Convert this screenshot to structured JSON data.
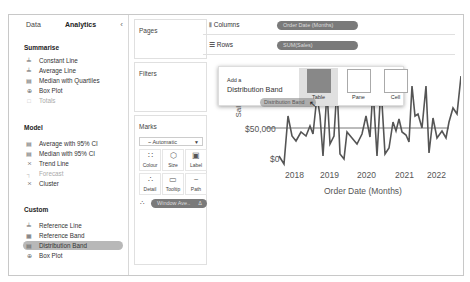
{
  "left_panel": {
    "tabs": [
      {
        "label": "Data"
      },
      {
        "label": "Analytics"
      }
    ],
    "collapse_icon": "chevron-left",
    "sections": {
      "summarise": {
        "title": "Summarise",
        "items": [
          {
            "label": "Constant Line",
            "icon": "constant-line-icon",
            "enabled": true
          },
          {
            "label": "Average Line",
            "icon": "average-line-icon",
            "enabled": true
          },
          {
            "label": "Median with Quartiles",
            "icon": "median-quartiles-icon",
            "enabled": true
          },
          {
            "label": "Box Plot",
            "icon": "box-plot-icon",
            "enabled": true
          },
          {
            "label": "Totals",
            "icon": "totals-icon",
            "enabled": false
          }
        ]
      },
      "model": {
        "title": "Model",
        "items": [
          {
            "label": "Average with 95% CI",
            "icon": "average-ci-icon",
            "enabled": true
          },
          {
            "label": "Median with 95% CI",
            "icon": "median-ci-icon",
            "enabled": true
          },
          {
            "label": "Trend Line",
            "icon": "trend-line-icon",
            "enabled": true
          },
          {
            "label": "Forecast",
            "icon": "forecast-icon",
            "enabled": false
          },
          {
            "label": "Cluster",
            "icon": "cluster-icon",
            "enabled": true
          }
        ]
      },
      "custom": {
        "title": "Custom",
        "items": [
          {
            "label": "Reference Line",
            "icon": "reference-line-icon",
            "enabled": true
          },
          {
            "label": "Reference Band",
            "icon": "reference-band-icon",
            "enabled": true
          },
          {
            "label": "Distribution Band",
            "icon": "distribution-band-icon",
            "enabled": true,
            "highlighted": true
          },
          {
            "label": "Box Plot",
            "icon": "box-plot-icon",
            "enabled": true
          }
        ]
      }
    }
  },
  "cards": {
    "pages": {
      "title": "Pages"
    },
    "filters": {
      "title": "Filters"
    },
    "marks": {
      "title": "Marks",
      "mark_type": "Automatic",
      "buttons": [
        {
          "label": "Colour",
          "icon": "colour-icon"
        },
        {
          "label": "Size",
          "icon": "size-icon"
        },
        {
          "label": "Label",
          "icon": "label-icon"
        },
        {
          "label": "Detail",
          "icon": "detail-icon"
        },
        {
          "label": "Tooltip",
          "icon": "tooltip-icon"
        },
        {
          "label": "Path",
          "icon": "path-icon"
        }
      ],
      "field_pill": "Window Ave..",
      "field_pill_warning": "Δ"
    }
  },
  "shelves": {
    "columns": {
      "label": "Columns",
      "pill": "Order Date (Months)"
    },
    "rows": {
      "label": "Rows",
      "pill": "SUM(Sales)"
    }
  },
  "popup": {
    "line1": "Add a",
    "line2": "Distribution Band",
    "options": [
      {
        "label": "Table",
        "selected": true
      },
      {
        "label": "Pane",
        "selected": false
      },
      {
        "label": "Cell",
        "selected": false
      }
    ]
  },
  "drag_ghost": {
    "label": "Distribution Band"
  },
  "chart": {
    "y_axis_label": "Sales",
    "y_ticks": [
      "$50,000",
      "$0"
    ],
    "x_ticks": [
      "2018",
      "2019",
      "2020",
      "2021",
      "2022"
    ],
    "x_axis_label": "Order Date (Months)",
    "line_color": "#555555",
    "reference_line": "$50,000"
  }
}
